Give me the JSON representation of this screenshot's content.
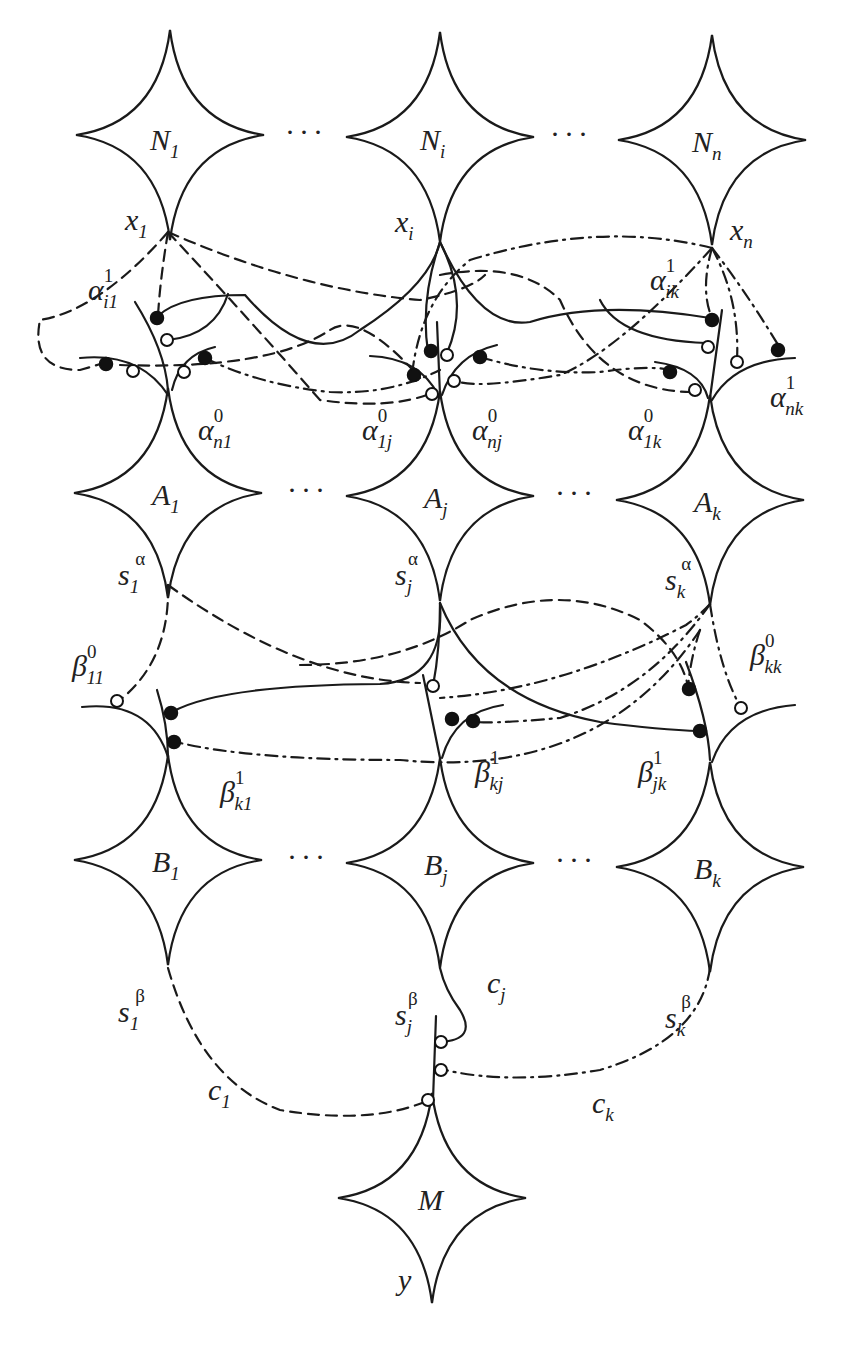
{
  "diagram": {
    "type": "pipeline-of-components",
    "rows": {
      "N": {
        "nodes": [
          {
            "id": "N1",
            "label": "N",
            "sub": "1",
            "port": "x",
            "port_sub": "1",
            "cx": 170,
            "cy": 135
          },
          {
            "id": "Ni",
            "label": "N",
            "sub": "i",
            "port": "x",
            "port_sub": "i",
            "cx": 440,
            "cy": 137
          },
          {
            "id": "Nn",
            "label": "N",
            "sub": "n",
            "port": "x",
            "port_sub": "n",
            "cx": 712,
            "cy": 140
          }
        ]
      },
      "A": {
        "nodes": [
          {
            "id": "A1",
            "label": "A",
            "sub": "1",
            "port": "s",
            "port_sub": "1",
            "port_sup": "α",
            "cx": 168,
            "cy": 493
          },
          {
            "id": "Aj",
            "label": "A",
            "sub": "j",
            "port": "s",
            "port_sub": "j",
            "port_sup": "α",
            "cx": 440,
            "cy": 496
          },
          {
            "id": "Ak",
            "label": "A",
            "sub": "k",
            "port": "s",
            "port_sub": "k",
            "port_sup": "α",
            "cx": 710,
            "cy": 500
          }
        ]
      },
      "B": {
        "nodes": [
          {
            "id": "B1",
            "label": "B",
            "sub": "1",
            "port": "s",
            "port_sub": "1",
            "port_sup": "β",
            "cx": 168,
            "cy": 860
          },
          {
            "id": "Bj",
            "label": "B",
            "sub": "j",
            "port": "s",
            "port_sub": "j",
            "port_sup": "β",
            "cx": 440,
            "cy": 863
          },
          {
            "id": "Bk",
            "label": "B",
            "sub": "k",
            "port": "s",
            "port_sub": "k",
            "port_sup": "β",
            "cx": 710,
            "cy": 867
          }
        ]
      },
      "M": {
        "nodes": [
          {
            "id": "M",
            "label": "M",
            "port": "y",
            "cx": 432,
            "cy": 1198
          }
        ]
      }
    },
    "ellipsis": "···",
    "edge_labels": {
      "alpha": [
        {
          "base": "α",
          "sup": "1",
          "sub": "i1"
        },
        {
          "base": "α",
          "sup": "0",
          "sub": "n1"
        },
        {
          "base": "α",
          "sup": "0",
          "sub": "1j"
        },
        {
          "base": "α",
          "sup": "0",
          "sub": "nj"
        },
        {
          "base": "α",
          "sup": "1",
          "sub": "ik"
        },
        {
          "base": "α",
          "sup": "0",
          "sub": "1k"
        },
        {
          "base": "α",
          "sup": "1",
          "sub": "nk"
        }
      ],
      "beta": [
        {
          "base": "β",
          "sup": "0",
          "sub": "11"
        },
        {
          "base": "β",
          "sup": "1",
          "sub": "k1"
        },
        {
          "base": "β",
          "sup": "1",
          "sub": "kj"
        },
        {
          "base": "β",
          "sup": "1",
          "sub": "jk"
        },
        {
          "base": "β",
          "sup": "0",
          "sub": "kk"
        }
      ],
      "c": [
        {
          "base": "c",
          "sub": "1"
        },
        {
          "base": "c",
          "sub": "j"
        },
        {
          "base": "c",
          "sub": "k"
        }
      ]
    },
    "line_styles": {
      "solid": "from N_i / s_j / c_j",
      "dashed": "from N_1 / s_1 / c_1",
      "dashdot": "from N_n / s_k / c_k"
    },
    "connector_markers": {
      "filled": "filled-circle",
      "open": "open-circle"
    },
    "colors": {
      "ink": "#1a1a1a",
      "background": "#ffffff"
    }
  }
}
